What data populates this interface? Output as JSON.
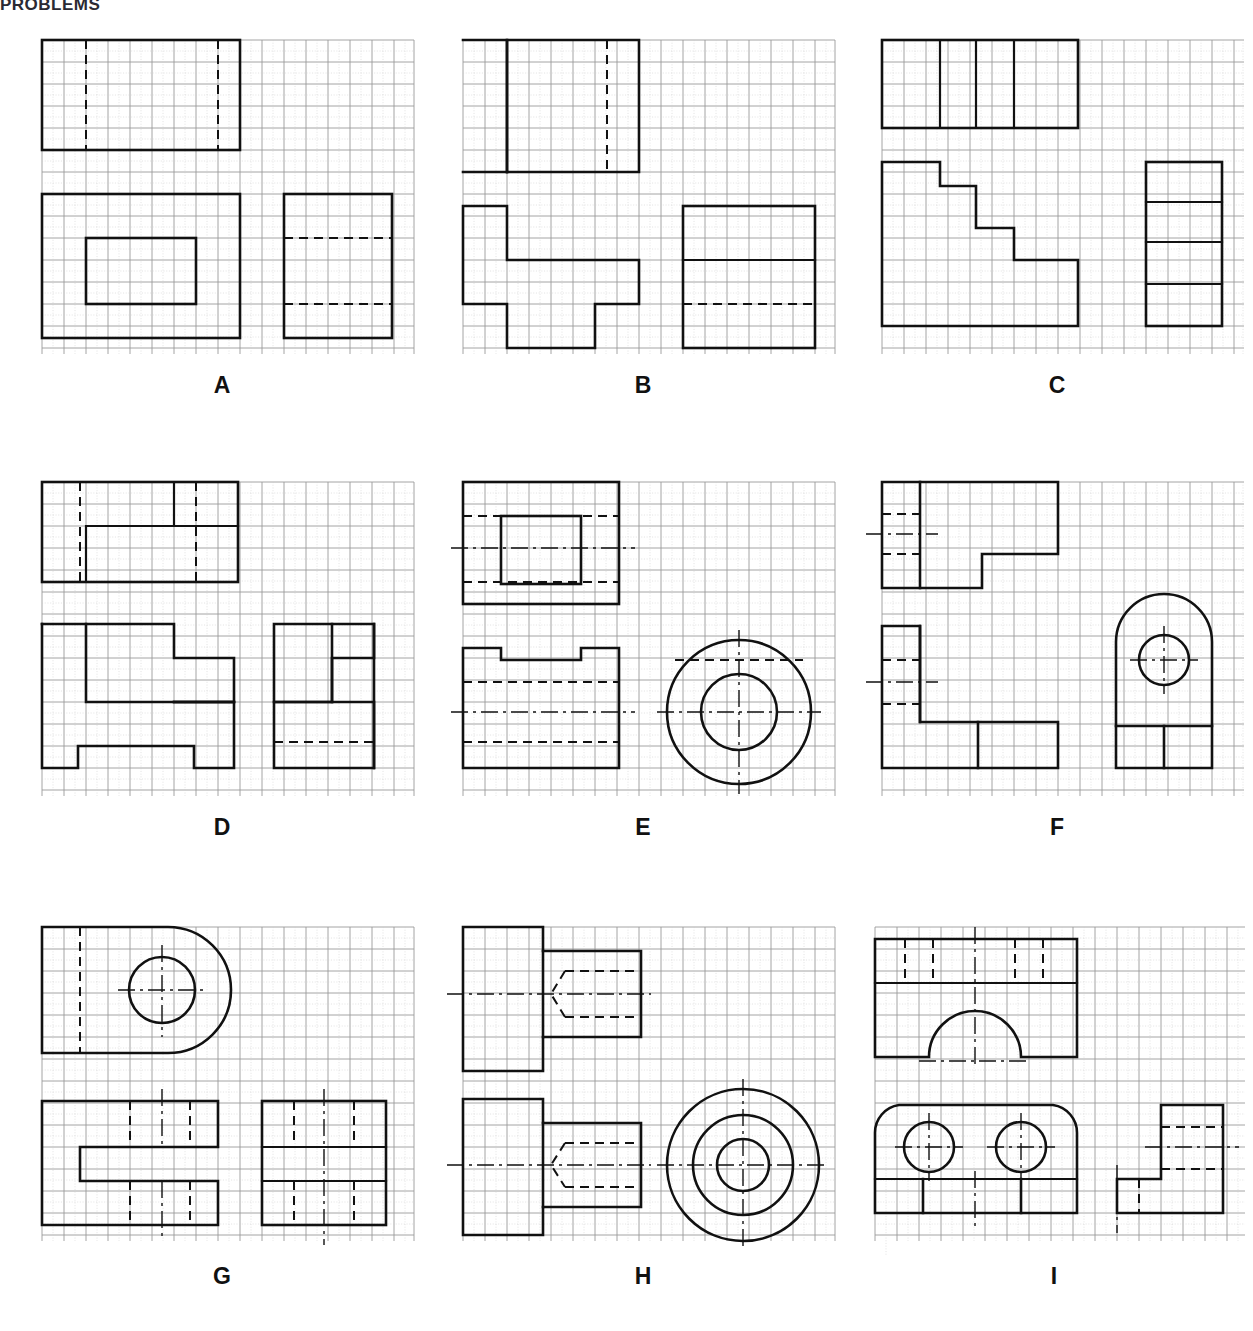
{
  "document": {
    "type": "orthographic-projection-worksheet",
    "cropped_header_text": "PROBLEMS",
    "grid": {
      "cell_px": 22,
      "major_stroke": "#9a9a9a",
      "minor_stroke": "#cfcfcf",
      "cols": 17,
      "rows": 15
    },
    "line_styles": {
      "visible": "#111",
      "hidden": "#111 dashed",
      "center": "#111 dash-dot"
    }
  },
  "panels": [
    {
      "id": "A",
      "label": "A",
      "col": 0,
      "row": 0,
      "views": [
        "top",
        "front",
        "right-side"
      ],
      "features": [
        "rectangular-block",
        "rectangular-recess",
        "hidden-lines"
      ],
      "top_view": {
        "x": 0,
        "y": 0,
        "w": 9,
        "h": 5,
        "hidden_vlines": [
          2,
          7
        ]
      },
      "front_view": {
        "x": 0,
        "y": 7,
        "w": 9,
        "h": 6,
        "inner_rect": {
          "x": 2,
          "y": 9,
          "w": 5,
          "h": 3
        }
      },
      "side_view": {
        "x": 11,
        "y": 7,
        "w": 4.5,
        "h": 6,
        "hidden_hlines": [
          9,
          12
        ]
      }
    },
    {
      "id": "B",
      "label": "B",
      "col": 1,
      "row": 0,
      "views": [
        "top",
        "front",
        "right-side"
      ],
      "features": [
        "stepped-block",
        "notch",
        "hidden-line"
      ],
      "top_view": {
        "x": 0,
        "y": 0,
        "w": 8,
        "h": 5,
        "hidden_vlines": [
          6
        ]
      },
      "front_view": {
        "x": 0,
        "y": 7,
        "w": 8,
        "h": 6
      },
      "side_view": {
        "x": 11,
        "y": 7,
        "w": 5.5,
        "h": 5,
        "hidden_hlines": [
          11
        ]
      }
    },
    {
      "id": "C",
      "label": "C",
      "col": 2,
      "row": 0,
      "views": [
        "top",
        "front",
        "right-side"
      ],
      "features": [
        "staircase-profile",
        "stepped-block"
      ],
      "top_view": {
        "x": 0,
        "y": 0,
        "w": 9,
        "h": 4,
        "divider_vlines": [
          3,
          4.5,
          6
        ]
      },
      "front_view": {
        "x": 0,
        "y": 6,
        "w": 9,
        "h": 7
      },
      "side_view": {
        "x": 12,
        "y": 6,
        "w": 3.5,
        "h": 7,
        "divider_hlines": [
          7.8,
          9.6,
          11.2
        ]
      }
    },
    {
      "id": "D",
      "label": "D",
      "col": 0,
      "row": 1,
      "views": [
        "top",
        "front",
        "right-side"
      ],
      "features": [
        "stepped-block",
        "rib",
        "hidden-lines",
        "notch"
      ],
      "top_view": {
        "x": 0,
        "y": 0,
        "w": 9,
        "h": 5,
        "hidden_vlines": [
          2,
          7
        ]
      },
      "front_view": {
        "x": 0,
        "y": 7,
        "w": 9,
        "h": 7
      },
      "side_view": {
        "x": 11.5,
        "y": 7,
        "w": 5,
        "h": 7,
        "hidden_hlines": [
          12.5
        ]
      }
    },
    {
      "id": "E",
      "label": "E",
      "col": 1,
      "row": 1,
      "views": [
        "top",
        "front",
        "right-side-circular"
      ],
      "features": [
        "cylindrical-boss",
        "through-hole",
        "centerlines",
        "keyway-slot"
      ],
      "top_view": {
        "x": 0,
        "y": 0,
        "w": 7,
        "h": 5,
        "inner_rect": {
          "x": 2,
          "y": 1.2,
          "w": 3.3,
          "h": 3.0
        }
      },
      "front_view": {
        "x": 0,
        "y": 7,
        "w": 7,
        "h": 5.5,
        "slot": {
          "x": 1.8,
          "w": 3.4,
          "depth": 0.6
        }
      },
      "side_view": {
        "cx": 12.2,
        "cy": 10.0,
        "r_outer": 3.3,
        "r_inner": 1.7
      }
    },
    {
      "id": "F",
      "label": "F",
      "col": 2,
      "row": 1,
      "views": [
        "top",
        "front",
        "right-side-arched"
      ],
      "features": [
        "L-shaped-bracket",
        "arched-top",
        "through-hole",
        "centerlines"
      ],
      "top_view": {
        "x": 0,
        "y": 0,
        "w": 9,
        "h": 5
      },
      "front_view": {
        "x": 0,
        "y": 7,
        "w": 9,
        "h": 6.5
      },
      "side_view": {
        "x": 11.5,
        "y": 7.3,
        "w": 4.5,
        "h": 6.2,
        "arch_radius": 2.25,
        "hole": {
          "cx": 13.4,
          "cy": 9.8,
          "r": 1.0
        }
      }
    },
    {
      "id": "G",
      "label": "G",
      "col": 0,
      "row": 2,
      "views": [
        "top-rounded",
        "front",
        "right-side"
      ],
      "features": [
        "U-shaped-bracket",
        "rounded-end",
        "through-hole",
        "slot",
        "hidden-lines"
      ],
      "top_view": {
        "x": 0,
        "y": 0,
        "w": 8,
        "h": 6.5,
        "rounded_end_r": 3.2,
        "hole": {
          "cx": 5.0,
          "cy": 3.3,
          "r": 1.6
        }
      },
      "front_view": {
        "x": 0,
        "y": 8.5,
        "w": 8,
        "h": 5.5,
        "slot_depth": 3.2
      },
      "side_view": {
        "x": 10.5,
        "y": 8.5,
        "w": 5.5,
        "h": 5.5,
        "divider_hlines": [
          11.0,
          12.3
        ]
      }
    },
    {
      "id": "H",
      "label": "H",
      "col": 1,
      "row": 2,
      "views": [
        "top",
        "front",
        "right-side-circular"
      ],
      "features": [
        "shouldered-shaft",
        "blind-drilled-hole",
        "conical-point",
        "three-concentric-circles"
      ],
      "top_view": {
        "x": 0,
        "y": 0,
        "w": 8,
        "h": 6
      },
      "front_view": {
        "x": 0,
        "y": 8,
        "w": 8,
        "h": 6
      },
      "side_view": {
        "cx": 12.3,
        "cy": 11.0,
        "r_outer": 3.4,
        "r_mid": 2.3,
        "r_inner": 1.2
      }
    },
    {
      "id": "I",
      "label": "I",
      "col": 2,
      "row": 2,
      "views": [
        "front-with-arch",
        "top-rounded",
        "right-side-L"
      ],
      "features": [
        "base-plate",
        "semicircular-arch-cutout",
        "two-through-holes",
        "rounded-corners",
        "centerlines"
      ],
      "front_view": {
        "x": 0,
        "y": 0,
        "w": 9.5,
        "h": 6,
        "arch": {
          "cx": 4.3,
          "r": 2.5
        }
      },
      "top_view": {
        "x": 0,
        "y": 8,
        "w": 9.5,
        "h": 6.5,
        "holes": [
          {
            "cx": 2.3,
            "cy": 11.0,
            "r": 1.2
          },
          {
            "cx": 6.3,
            "cy": 11.0,
            "r": 1.2
          }
        ]
      },
      "side_view": {
        "x": 11.5,
        "y": 8,
        "w": 4.5,
        "h": 6.5
      }
    }
  ],
  "labels": {
    "A": "A",
    "B": "B",
    "C": "C",
    "D": "D",
    "E": "E",
    "F": "F",
    "G": "G",
    "H": "H",
    "I": "I"
  }
}
